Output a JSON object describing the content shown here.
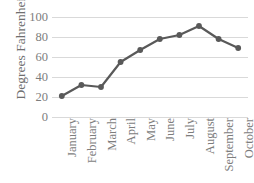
{
  "chart_data": {
    "type": "line",
    "title": "",
    "xlabel": "",
    "ylabel": "Degrees Fahrenheit",
    "categories": [
      "January",
      "February",
      "March",
      "April",
      "May",
      "June",
      "July",
      "August",
      "September",
      "October"
    ],
    "values": [
      21,
      32,
      30,
      55,
      67,
      78,
      82,
      91,
      78,
      69
    ],
    "series": [
      {
        "name": "Degrees Fahrenheit",
        "values": [
          21,
          32,
          30,
          55,
          67,
          78,
          82,
          91,
          78,
          69
        ]
      }
    ],
    "ylim": [
      0,
      100
    ],
    "y_ticks": [
      0,
      20,
      40,
      60,
      80,
      100
    ],
    "y_tick_labels": [
      "0",
      "20",
      "40",
      "60",
      "80",
      "100"
    ],
    "grid": true,
    "grid_axis": "y",
    "legend": false,
    "legend_position": "none",
    "markers": true,
    "marker_shape": "circle",
    "line_color": "#595959",
    "marker_color": "#595959",
    "grid_color": "#d9d9d9",
    "text_color": "#7d7d7d",
    "background_color": "#ffffff",
    "x_tick_rotation": -90
  }
}
